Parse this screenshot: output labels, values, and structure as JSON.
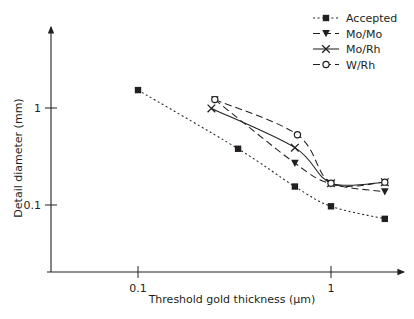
{
  "chart_data": {
    "type": "line",
    "title": "",
    "subtitle": "",
    "xlabel": "Threshold gold thickness (µm)",
    "ylabel": "Detail diameter (mm)",
    "xscale": "log",
    "yscale": "log",
    "xlim": [
      0.055,
      2.6
    ],
    "ylim": [
      0.045,
      2.6
    ],
    "xticks": [
      0.1,
      1
    ],
    "xticklabels": [
      "0.1",
      "1"
    ],
    "yticks": [
      1,
      0.1
    ],
    "yticklabels": [
      "1",
      "0.1"
    ],
    "grid": false,
    "legend_position": "top-right",
    "axis_color": "#231f20",
    "series": [
      {
        "name": "Accepted",
        "marker": "filled-square",
        "linestyle": "dotted",
        "color": "#231f20",
        "x": [
          0.1,
          0.33,
          0.65,
          1.0,
          1.9
        ],
        "y": [
          1.53,
          0.38,
          0.155,
          0.097,
          0.072
        ]
      },
      {
        "name": "Mo/Mo",
        "marker": "filled-triangle",
        "linestyle": "dashed",
        "color": "#231f20",
        "x": [
          0.25,
          0.65,
          1.0,
          1.9
        ],
        "y": [
          1.22,
          0.27,
          0.165,
          0.137
        ]
      },
      {
        "name": "Mo/Rh",
        "marker": "cross",
        "linestyle": "solid",
        "color": "#231f20",
        "x": [
          0.24,
          0.65,
          1.0,
          1.9
        ],
        "y": [
          0.99,
          0.39,
          0.168,
          0.172
        ]
      },
      {
        "name": "W/Rh",
        "marker": "open-circle",
        "linestyle": "dashed",
        "color": "#231f20",
        "x": [
          0.25,
          0.67,
          1.0,
          1.9
        ],
        "y": [
          1.22,
          0.53,
          0.168,
          0.172
        ]
      }
    ]
  },
  "legend": {
    "items": [
      {
        "label": "Accepted"
      },
      {
        "label": "Mo/Mo"
      },
      {
        "label": "Mo/Rh"
      },
      {
        "label": "W/Rh"
      }
    ]
  },
  "axes": {
    "x_title": "Threshold gold thickness (µm)",
    "y_title": "Detail diameter (mm)",
    "x_tick_0": "0.1",
    "x_tick_1": "1",
    "y_tick_0": "1",
    "y_tick_1": "0.1"
  }
}
